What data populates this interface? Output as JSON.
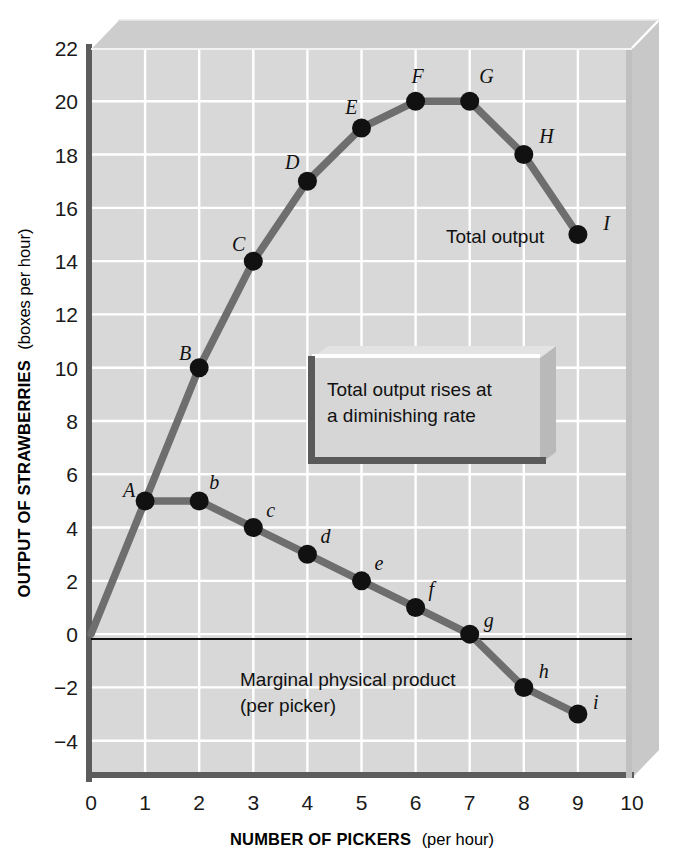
{
  "chart_data": {
    "type": "line",
    "title": "",
    "xlabel": "NUMBER OF PICKERS",
    "xlabel_sub": "(per hour)",
    "ylabel": "OUTPUT OF STRAWBERRIES",
    "ylabel_sub": "(boxes per hour)",
    "xlim": [
      0,
      10
    ],
    "ylim": [
      -5.4,
      22
    ],
    "xticks": [
      "0",
      "1",
      "2",
      "3",
      "4",
      "5",
      "6",
      "7",
      "8",
      "9",
      "10"
    ],
    "yticks": [
      "22",
      "20",
      "18",
      "16",
      "14",
      "12",
      "10",
      "8",
      "6",
      "4",
      "2",
      "0",
      "−2",
      "−4"
    ],
    "ytick_values": [
      22,
      20,
      18,
      16,
      14,
      12,
      10,
      8,
      6,
      4,
      2,
      0,
      -2,
      -4
    ],
    "grid": true,
    "legend_position": "inline-annotation",
    "series": [
      {
        "name": "Total output",
        "label": "Total output",
        "x": [
          0,
          1,
          2,
          3,
          4,
          5,
          6,
          7,
          8,
          9
        ],
        "values": [
          0,
          5,
          10,
          14,
          17,
          19,
          20,
          20,
          18,
          15
        ],
        "point_labels": [
          "",
          "A",
          "B",
          "C",
          "D",
          "E",
          "F",
          "G",
          "H",
          "I"
        ],
        "color": "#6e6e6e"
      },
      {
        "name": "Marginal physical product",
        "label": "Marginal physical product",
        "label_line2": "(per picker)",
        "x": [
          1,
          2,
          3,
          4,
          5,
          6,
          7,
          8,
          9
        ],
        "values": [
          5,
          5,
          4,
          3,
          2,
          1,
          0,
          -2,
          -3
        ],
        "point_labels": [
          "A",
          "b",
          "c",
          "d",
          "e",
          "f",
          "g",
          "h",
          "i"
        ],
        "color": "#6e6e6e"
      }
    ],
    "annotations": [
      {
        "name": "callout",
        "line1": "Total output rises at",
        "line2": "a diminishing rate"
      }
    ],
    "colors": {
      "plot_background": "#d7d7d7",
      "grid": "#ffffff",
      "curve": "#6e6e6e",
      "marker": "#111111",
      "axis": "#555555",
      "zero_line": "#111111",
      "page_background": "#ffffff",
      "panel_3d_top": "#cfcfcf",
      "panel_3d_side": "#c9c9c9",
      "callout_fill": "#d4d4d4",
      "callout_edge": "#5a5a5a"
    }
  }
}
